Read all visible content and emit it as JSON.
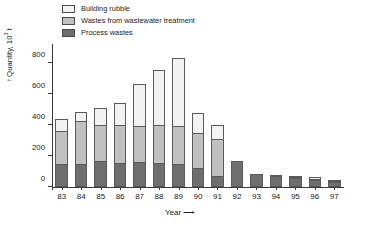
{
  "chart_data": {
    "type": "bar",
    "title": "",
    "subtitle": "",
    "stacked": true,
    "xlabel": "Year",
    "xlabel_arrow": "⟶",
    "ylabel": "Quantity, 10",
    "ylabel_exponent": "3",
    "ylabel_unit": " t",
    "ylabel_arrow": "↑",
    "ylim": [
      0,
      900
    ],
    "yticks": [
      0,
      200,
      400,
      600,
      800
    ],
    "ytick_labels": [
      "0",
      "200",
      "400",
      "600",
      "800"
    ],
    "grid": false,
    "legend_position": "top-left",
    "categories": [
      "83",
      "84",
      "85",
      "86",
      "87",
      "88",
      "89",
      "90",
      "91",
      "92",
      "93",
      "94",
      "95",
      "96",
      "97"
    ],
    "series": [
      {
        "name": "Process wastes",
        "color": "#6e6e6e",
        "values": [
          145,
          145,
          170,
          155,
          160,
          155,
          145,
          125,
          70,
          165,
          85,
          70,
          55,
          45,
          35
        ]
      },
      {
        "name": "Wastes from wastewater treatment",
        "color": "#c0c0c0",
        "values": [
          215,
          280,
          230,
          245,
          235,
          245,
          250,
          220,
          240,
          0,
          0,
          0,
          5,
          5,
          5
        ]
      },
      {
        "name": "Building rubble",
        "color": "#f2f2f2",
        "values": [
          80,
          55,
          105,
          140,
          265,
          355,
          435,
          130,
          90,
          0,
          0,
          10,
          10,
          10,
          5
        ]
      }
    ],
    "totals": [
      440,
      480,
      505,
      540,
      660,
      755,
      830,
      475,
      400,
      165,
      85,
      80,
      70,
      60,
      45
    ]
  },
  "legend": {
    "items": [
      {
        "label": "Building rubble",
        "color": "#f2f2f2"
      },
      {
        "label": "Wastes from wastewater treatment",
        "color": "#c0c0c0"
      },
      {
        "label": "Process wastes",
        "color": "#6e6e6e"
      }
    ]
  }
}
